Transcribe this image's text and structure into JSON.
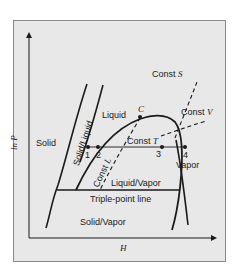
{
  "axes": {
    "y_label": "ln P",
    "x_label": "H"
  },
  "regions": {
    "solid": "Solid",
    "liquid": "Liquid",
    "vapor": "Vapor",
    "solid_liquid": "Solid/Liquid",
    "liquid_vapor": "Liquid/Vapor",
    "solid_vapor": "Solid/Vapor",
    "triple_point_line": "Triple-point line"
  },
  "critical_point": "C",
  "constant_lines": {
    "entropy": {
      "prefix": "Const",
      "var": "S"
    },
    "volume": {
      "prefix": "Const",
      "var": "V"
    },
    "temperature": {
      "prefix": "Const",
      "var": "T"
    },
    "quality": {
      "prefix": "Const",
      "var": "L"
    }
  },
  "points": [
    "1",
    "2",
    "3",
    "4"
  ],
  "colors": {
    "panel_bg": "#e8e8e8",
    "panel_border": "#8a8a8a",
    "line": "#1a1a1a"
  }
}
